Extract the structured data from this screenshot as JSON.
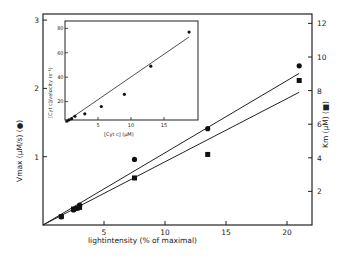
{
  "chart_data": {
    "type": "scatter",
    "title": "",
    "xlabel": "lightintensity   (% of maximal)",
    "ylabel_left": "Vmax   (μM/s)  (●)",
    "ylabel_right": "Km   (μM)  (■)",
    "xlim": [
      0,
      22
    ],
    "ylim_left": [
      0,
      3
    ],
    "ylim_right": [
      0,
      12.5
    ],
    "x_ticks": [
      "5",
      "10",
      "15",
      "20"
    ],
    "y_ticks_left": [
      "1",
      "2",
      "3"
    ],
    "y_ticks_right": [
      "2",
      "4",
      "6",
      "8",
      "10",
      "12"
    ],
    "grid": false,
    "series": [
      {
        "name": "Vmax",
        "marker": "circle",
        "axis": "left",
        "x": [
          1.5,
          2.5,
          2.7,
          3.0,
          7.5,
          13.5,
          21.0
        ],
        "y": [
          0.12,
          0.22,
          0.24,
          0.29,
          0.96,
          1.41,
          2.33
        ],
        "fit_line": {
          "x": [
            0,
            21
          ],
          "y": [
            0,
            2.22
          ]
        }
      },
      {
        "name": "Km",
        "marker": "square",
        "axis": "right",
        "x": [
          1.5,
          2.5,
          2.8,
          3.0,
          7.5,
          13.5,
          21.0
        ],
        "y": [
          0.5,
          0.95,
          1.0,
          1.05,
          2.8,
          4.2,
          8.6
        ],
        "fit_line": {
          "x": [
            0,
            21
          ],
          "y": [
            0,
            7.9
          ]
        }
      }
    ],
    "inset": {
      "type": "scatter",
      "xlabel": "[Cyt c]  (μM)",
      "ylabel": "[Cyt c]/velocity  (s⁻¹)",
      "xlim": [
        0,
        20
      ],
      "ylim": [
        0,
        85
      ],
      "x_ticks": [
        "5",
        "10",
        "15"
      ],
      "y_ticks": [
        "20",
        "40",
        "60",
        "80"
      ],
      "x": [
        0.3,
        0.6,
        1.0,
        1.5,
        3.0,
        5.5,
        9.0,
        13.0,
        18.8
      ],
      "y": [
        4,
        5,
        6,
        8,
        10,
        16,
        26,
        49,
        77
      ],
      "fit_line": {
        "x": [
          0,
          18.8
        ],
        "y": [
          3,
          73
        ]
      }
    }
  },
  "labels": {
    "xlabel": "lightintensity   (% of maximal)",
    "ylabel_left": "Vmax   (μM/s)  (●)",
    "ylabel_right": "Km  (μM)  (■)",
    "inset_xlabel": "[Cyt c]  (μM)",
    "inset_ylabel": "[Cyt c]/velocity  (s⁻¹)"
  }
}
